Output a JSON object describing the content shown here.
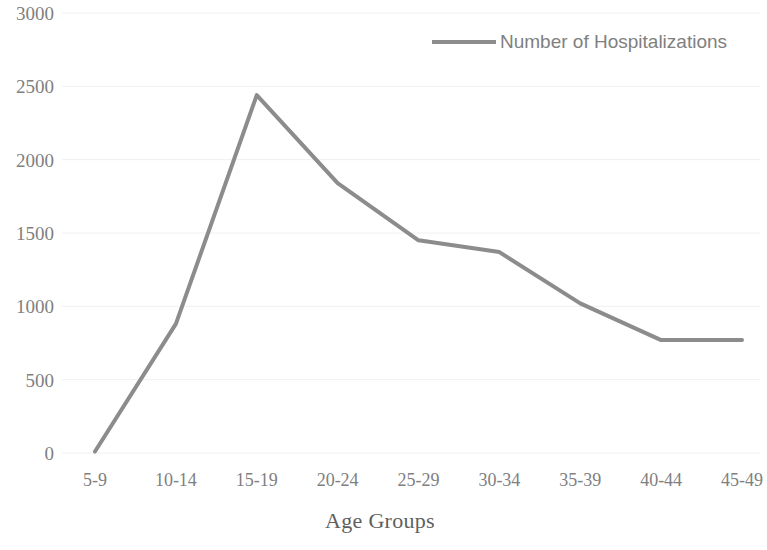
{
  "chart_data": {
    "type": "line",
    "title": "",
    "subtitle": "",
    "xlabel": "Age Groups",
    "ylabel": "",
    "categories": [
      "5-9",
      "10-14",
      "15-19",
      "20-24",
      "25-29",
      "30-34",
      "35-39",
      "40-44",
      "45-49"
    ],
    "series": [
      {
        "name": "Number of Hospitalizations",
        "values": [
          10,
          880,
          2440,
          1840,
          1450,
          1370,
          1020,
          770,
          770
        ],
        "color": "#8c8c8c"
      }
    ],
    "ylim": [
      0,
      3000
    ],
    "y_ticks": [
      "0",
      "500",
      "1000",
      "1500",
      "2000",
      "2500",
      "3000"
    ],
    "y_tick_values": [
      0,
      500,
      1000,
      1500,
      2000,
      2500,
      3000
    ],
    "grid": true,
    "grid_color": "#f0f0f0",
    "legend_position": "top-right",
    "legend_entries": [
      "Number of Hospitalizations"
    ],
    "annotations": []
  },
  "legend": {
    "label": "Number of Hospitalizations",
    "swatch_name": "line-swatch"
  },
  "axes": {
    "x_title": "Age Groups"
  }
}
